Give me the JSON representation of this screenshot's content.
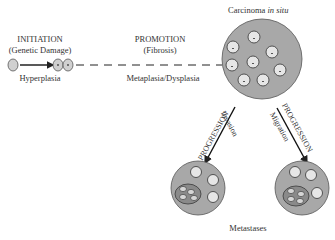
{
  "stages": {
    "initiation": {
      "title": "INITIATION",
      "subtitle": "(Genetic Damage)",
      "below": "Hyperplasia"
    },
    "promotion": {
      "title": "PROMOTION",
      "subtitle": "(Fibrosis)",
      "below": "Metaplasia/Dysplasia"
    },
    "carcinoma": {
      "title_main": "Carcinoma ",
      "title_italic": "in situ"
    },
    "progression_left": {
      "title": "PROGRESSION",
      "sub": "Invasion"
    },
    "progression_right": {
      "title": "PROGRESSION",
      "sub": "Migration"
    },
    "metastases": {
      "label": "Metastases"
    }
  },
  "colors": {
    "tumor_fill": "#a8a8a8",
    "cell_fill": "#e6e6e6",
    "outline": "#444444",
    "inner_cluster_fill": "#8a8a8a"
  }
}
